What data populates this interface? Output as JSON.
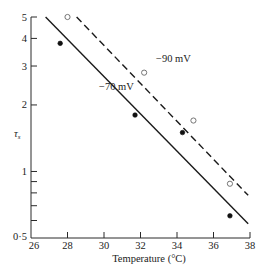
{
  "chart_data": {
    "type": "scatter",
    "title": "",
    "xlabel": "Temperature (°C)",
    "ylabel": "τs",
    "xlim": [
      26,
      38
    ],
    "ylim": [
      0.5,
      5
    ],
    "yscale": "log",
    "grid": false,
    "x_ticks": [
      26,
      28,
      30,
      32,
      34,
      36,
      38
    ],
    "x_tick_labels": [
      "26",
      "28",
      "30",
      "32",
      "34",
      "36",
      "38"
    ],
    "y_ticks": [
      0.5,
      0.6,
      0.7,
      0.8,
      0.9,
      1,
      2,
      3,
      4,
      5
    ],
    "y_tick_labels": [
      "0·5",
      "",
      "",
      "",
      "",
      "1",
      "2",
      "3",
      "4",
      "5"
    ],
    "series": [
      {
        "name": "-70 mV",
        "marker": "filled-circle",
        "line_style": "solid",
        "points": [
          {
            "x": 27.6,
            "y": 3.8
          },
          {
            "x": 31.7,
            "y": 1.8
          },
          {
            "x": 34.3,
            "y": 1.5
          },
          {
            "x": 36.9,
            "y": 0.63
          }
        ],
        "fit_line": [
          {
            "x": 26.8,
            "y": 5.0
          },
          {
            "x": 37.9,
            "y": 0.58
          }
        ]
      },
      {
        "name": "-90 mV",
        "marker": "open-circle",
        "line_style": "dashed",
        "points": [
          {
            "x": 28.0,
            "y": 5.0
          },
          {
            "x": 32.2,
            "y": 2.8
          },
          {
            "x": 34.9,
            "y": 1.7
          },
          {
            "x": 36.9,
            "y": 0.88
          }
        ],
        "fit_line": [
          {
            "x": 28.5,
            "y": 5.0
          },
          {
            "x": 37.9,
            "y": 0.78
          }
        ]
      }
    ],
    "annotations": [
      {
        "text": "−90 mV",
        "x": 33.2,
        "y": 3.3
      },
      {
        "text": "−70 mV",
        "x": 29.9,
        "y": 2.35
      }
    ]
  },
  "labels": {
    "xlabel": "Temperature (°C)",
    "ylabel_main": "τ",
    "ylabel_sub": "s",
    "annot_90": "−90 mV",
    "annot_70": "−70 mV"
  }
}
